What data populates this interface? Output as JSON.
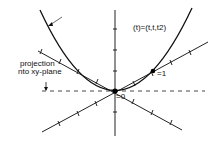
{
  "figure": {
    "curve_label": "(t)=(t,t,t2)",
    "projection_label_line1": "projection",
    "projection_label_line2": "nto xy-plane",
    "point_t0_label": "=0",
    "point_t1_label": "=1"
  },
  "colors": {
    "ink": "#111111",
    "background": "#ffffff"
  }
}
